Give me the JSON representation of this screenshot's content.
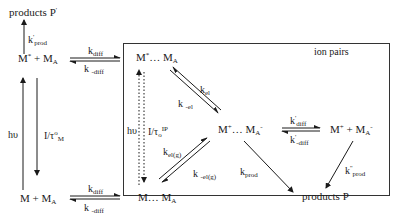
{
  "diagram": {
    "type": "reaction-scheme",
    "box_label": "ion pairs",
    "species": {
      "products_p_prime": "products P",
      "excited_pair": "M* + MA",
      "ground_pair": "M + MA",
      "excited_complex": "M*… MA",
      "ion_pair": "M+… MA-",
      "free_ions": "M+ + MA-",
      "ground_complex": "M… MA",
      "products_p": "products P"
    },
    "rate_labels": {
      "k_prod_prime": "k' prod",
      "k_diff_top": "kdiff",
      "k_minus_diff_top": "k -diff",
      "k_diff_bottom": "kdiff",
      "k_minus_diff_bottom": "k -diff",
      "k_el": "kel",
      "k_minus_el": "k -el",
      "k_el_g": "kel(g)",
      "k_minus_el_g": "k -el(g)",
      "k_diff_prime": "k' diff",
      "k_minus_diff_prime": "k' -diff",
      "k_prod": "kprod",
      "k_prod_double_prime": "k'' prod",
      "hv_left": "hυ",
      "tau_left": "1/τ°M",
      "hv_box": "hυ",
      "tau_box": "1/τ°IP"
    }
  }
}
